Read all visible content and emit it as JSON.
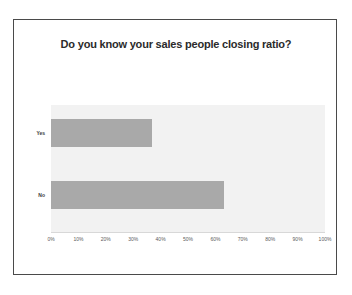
{
  "slide": {
    "title": "Do you know your sales people closing ratio?"
  },
  "chart_data": {
    "type": "bar",
    "orientation": "horizontal",
    "title": "Do you know your sales people closing ratio?",
    "categories": [
      "Yes",
      "No"
    ],
    "values": [
      37,
      63
    ],
    "series": [
      {
        "name": "Response share",
        "values": [
          37,
          63
        ]
      }
    ],
    "xlabel": "",
    "ylabel": "",
    "xlim": [
      0,
      100
    ],
    "xticks": [
      0,
      10,
      20,
      30,
      40,
      50,
      60,
      70,
      80,
      90,
      100
    ],
    "xtick_labels": [
      "0%",
      "10%",
      "20%",
      "30%",
      "40%",
      "50%",
      "60%",
      "70%",
      "80%",
      "90%",
      "100%"
    ],
    "value_format": "percent",
    "grid": false,
    "legend": false,
    "colors": {
      "bar": "#a9a9a9",
      "plot_background": "#f2f2f2",
      "frame": "#4a4a4a",
      "page_background": "#ffffff",
      "title_text": "#2b2b2b",
      "tick_text": "#5a5a5a"
    }
  }
}
